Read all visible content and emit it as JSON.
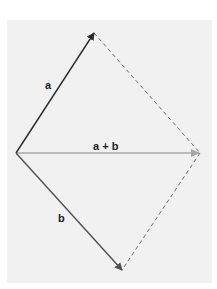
{
  "diagram": {
    "labels": {
      "a": "a",
      "sum": "a + b",
      "b": "b"
    },
    "points": {
      "origin": [
        16,
        153
      ],
      "a_tip": [
        94,
        33
      ],
      "sum_tip": [
        200,
        153
      ],
      "b_tip": [
        122,
        270
      ]
    },
    "colors": {
      "background": "#f1f1f1",
      "vector_a": "#2b2b2b",
      "vector_b": "#505050",
      "vector_sum": "#a8a8a8",
      "dashed": "#6a6a6a"
    }
  }
}
